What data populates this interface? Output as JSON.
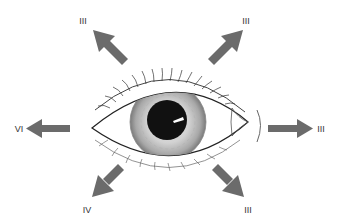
{
  "diagram": {
    "arrow_color": "#6b6b6b",
    "directions": [
      {
        "id": "up-left",
        "label": "III"
      },
      {
        "id": "up-right",
        "label": "III"
      },
      {
        "id": "left",
        "label": "VI"
      },
      {
        "id": "right",
        "label": "III"
      },
      {
        "id": "down-left",
        "label": "IV"
      },
      {
        "id": "down-right",
        "label": "III"
      }
    ]
  }
}
